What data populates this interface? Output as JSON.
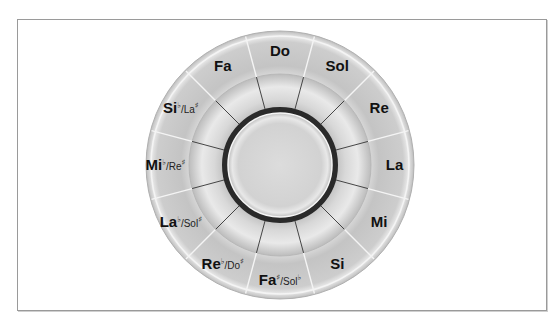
{
  "diagram": {
    "center": {
      "x": 280,
      "y": 165
    },
    "radii": {
      "outer": 134,
      "middle": 91,
      "dark_ring_outer": 58,
      "dark_ring_width": 6,
      "inner": 52
    },
    "colors": {
      "outer_ring": "#c9c9c9",
      "outer_ring_highlight": "#e6e6e6",
      "middle_ring": "#d4d4d4",
      "middle_ring_highlight": "#ececec",
      "dark_ring": "#2a2a2a",
      "center_disc": "#d8d8d8",
      "outer_divider": "#f4f4f4",
      "inner_divider": "#333333",
      "frame_border": "#9a9a9a"
    },
    "segments": [
      {
        "main": "Do",
        "acc_main": "",
        "sub": "",
        "acc_sub": ""
      },
      {
        "main": "Sol",
        "acc_main": "",
        "sub": "",
        "acc_sub": ""
      },
      {
        "main": "Re",
        "acc_main": "",
        "sub": "",
        "acc_sub": ""
      },
      {
        "main": "La",
        "acc_main": "",
        "sub": "",
        "acc_sub": ""
      },
      {
        "main": "Mi",
        "acc_main": "",
        "sub": "",
        "acc_sub": ""
      },
      {
        "main": "Si",
        "acc_main": "",
        "sub": "",
        "acc_sub": ""
      },
      {
        "main": "Fa",
        "acc_main": "♯",
        "sub": "/Sol",
        "acc_sub": "♭"
      },
      {
        "main": "Re",
        "acc_main": "♭",
        "sub": "/Do",
        "acc_sub": "♯"
      },
      {
        "main": "La",
        "acc_main": "♭",
        "sub": "/Sol",
        "acc_sub": "♯"
      },
      {
        "main": "Mi",
        "acc_main": "♭",
        "sub": "/Re",
        "acc_sub": "♯"
      },
      {
        "main": "Si",
        "acc_main": "♭",
        "sub": "/La",
        "acc_sub": "♯"
      },
      {
        "main": "Fa",
        "acc_main": "",
        "sub": "",
        "acc_sub": ""
      }
    ]
  }
}
